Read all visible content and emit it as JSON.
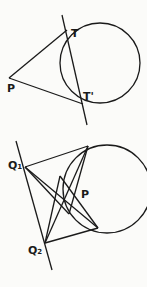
{
  "figure_top": {
    "labels": {
      "T": "T",
      "T_prime": "T'",
      "P": "P"
    },
    "circle": {
      "cx": 100,
      "cy": 63,
      "r": 40
    },
    "secant_line": {
      "x1": 62,
      "y1": 15,
      "x2": 87,
      "y2": 125
    },
    "point_P": {
      "x": 9,
      "y": 78
    },
    "point_T": {
      "x": 67,
      "y": 30
    },
    "point_T_prime": {
      "x": 83,
      "y": 104
    }
  },
  "figure_bottom": {
    "labels": {
      "Q1": "Q",
      "Q1_sub": "1",
      "Q2": "Q",
      "Q2_sub": "2",
      "P": "P"
    },
    "circle": {
      "cx": 107,
      "cy": 189,
      "r": 44
    },
    "line": {
      "x1": 16,
      "y1": 141,
      "x2": 52,
      "y2": 270
    },
    "point_Q1": {
      "x": 25,
      "y": 167
    },
    "point_Q2": {
      "x": 45,
      "y": 243
    },
    "tangent_top": {
      "x": 88,
      "y": 146
    },
    "tangent_bottom": {
      "x": 98,
      "y": 228
    },
    "chord_left_top": {
      "x": 60,
      "y": 176
    },
    "chord_left_bottom": {
      "x": 69,
      "y": 214
    }
  },
  "colors": {
    "stroke": "#1a1a1a",
    "background": "#fbfbf9"
  }
}
